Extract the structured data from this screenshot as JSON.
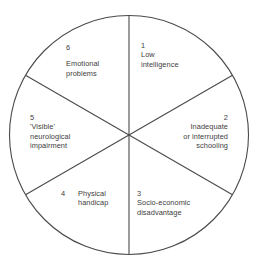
{
  "diagram": {
    "type": "pie-wheel",
    "sector_count": 6,
    "colors": {
      "background": "#ffffff",
      "stroke": "#4a4a4a",
      "text": "#3d3d3d"
    },
    "geometry": {
      "center_x": 129,
      "center_y": 135,
      "radius": 120,
      "sector_angle_degrees": 60,
      "first_divider_angle_degrees": 90
    },
    "sectors": [
      {
        "number": "1",
        "lines": [
          "Low",
          "intelligence"
        ],
        "align": "left",
        "position": "top-right"
      },
      {
        "number": "2",
        "lines": [
          "Inadequate",
          "or interrupted",
          "schooling"
        ],
        "align": "right",
        "position": "right"
      },
      {
        "number": "3",
        "lines": [
          "Socio-economic",
          "disadvantage"
        ],
        "align": "left",
        "position": "bottom-right"
      },
      {
        "number": "4",
        "lines": [
          "Physical",
          "handicap"
        ],
        "align": "left",
        "position": "bottom-left"
      },
      {
        "number": "5",
        "lines": [
          "'Visible'",
          "neurological",
          "impairment"
        ],
        "align": "left",
        "position": "left"
      },
      {
        "number": "6",
        "lines": [
          "Emotional",
          "problems"
        ],
        "align": "left",
        "position": "top-left"
      }
    ]
  }
}
